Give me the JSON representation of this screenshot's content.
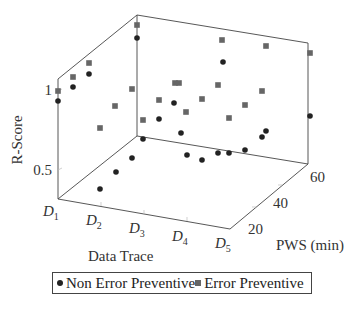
{
  "chart_data": {
    "type": "scatter",
    "subtype": "3d",
    "title": "",
    "xlabel": "Data Trace",
    "ylabel": "PWS (min)",
    "zlabel": "R-Score",
    "x_ticks": [
      "D1",
      "D2",
      "D3",
      "D4",
      "D5"
    ],
    "y_ticks": [
      "20",
      "40",
      "60"
    ],
    "z_ticks": [
      "0.5",
      "1"
    ],
    "grid": false,
    "legend_position": "bottom",
    "series": [
      {
        "name": "Non Error Preventive",
        "marker": "circle",
        "color": "#222222",
        "points_px": [
          [
            58,
            101
          ],
          [
            73,
            87
          ],
          [
            89,
            74
          ],
          [
            137,
            38
          ],
          [
            100,
            189
          ],
          [
            116,
            172
          ],
          [
            132,
            158
          ],
          [
            143,
            139
          ],
          [
            159,
            119
          ],
          [
            174,
            103
          ],
          [
            181,
            133
          ],
          [
            187,
            155
          ],
          [
            202,
            160
          ],
          [
            218,
            153
          ],
          [
            223,
            62
          ],
          [
            229,
            153
          ],
          [
            245,
            150
          ],
          [
            262,
            137
          ],
          [
            266,
            131
          ],
          [
            310,
            116
          ]
        ]
      },
      {
        "name": "Error Preventive",
        "marker": "square",
        "color": "#666666",
        "points_px": [
          [
            58,
            91
          ],
          [
            73,
            77
          ],
          [
            89,
            63
          ],
          [
            137,
            25
          ],
          [
            100,
            128
          ],
          [
            115,
            106
          ],
          [
            132,
            89
          ],
          [
            143,
            120
          ],
          [
            159,
            100
          ],
          [
            175,
            83
          ],
          [
            179,
            83
          ],
          [
            186,
            112
          ],
          [
            202,
            99
          ],
          [
            218,
            85
          ],
          [
            222,
            40
          ],
          [
            229,
            118
          ],
          [
            245,
            105
          ],
          [
            262,
            91
          ],
          [
            266,
            46
          ],
          [
            310,
            53
          ]
        ]
      }
    ]
  },
  "axes": {
    "x_label": "Data Trace",
    "y_label": "PWS (min)",
    "z_label": "R-Score",
    "x_ticks": [
      {
        "main": "D",
        "sub": "1"
      },
      {
        "main": "D",
        "sub": "2"
      },
      {
        "main": "D",
        "sub": "3"
      },
      {
        "main": "D",
        "sub": "4"
      },
      {
        "main": "D",
        "sub": "5"
      }
    ],
    "y_ticks": [
      "20",
      "40",
      "60"
    ],
    "z_ticks": [
      "0.5",
      "1"
    ]
  },
  "legend": {
    "items": [
      {
        "label": "Non Error Preventive",
        "marker": "circle"
      },
      {
        "label": "Error Preventive",
        "marker": "square"
      }
    ]
  }
}
